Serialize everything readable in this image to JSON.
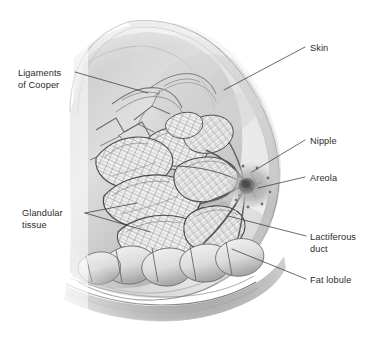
{
  "figure": {
    "name": "breast-anatomy-cross-section",
    "background_color": "#ffffff",
    "label_color": "#2b2b2b",
    "leader_color": "#3a3a3a",
    "illustration_style": "grayscale-pencil-medical-illustration"
  },
  "labels": [
    {
      "id": "ligaments-of-cooper",
      "lines": [
        "Ligaments",
        "of Cooper"
      ],
      "line1": "Ligaments",
      "line2": "of Cooper",
      "text_x": 18,
      "text_y": 76,
      "anchor": "start",
      "leader": "M 75 72 L 148 93"
    },
    {
      "id": "skin",
      "lines": [
        "Skin"
      ],
      "line1": "Skin",
      "text_x": 310,
      "text_y": 51,
      "anchor": "start",
      "leader": "M 305 47 L 224 90"
    },
    {
      "id": "nipple",
      "lines": [
        "Nipple"
      ],
      "line1": "Nipple",
      "text_x": 310,
      "text_y": 144,
      "anchor": "start",
      "leader": "M 305 140 L 252 172"
    },
    {
      "id": "areola",
      "lines": [
        "Areola"
      ],
      "line1": "Areola",
      "text_x": 310,
      "text_y": 181,
      "anchor": "start",
      "leader": "M 305 177 L 258 188"
    },
    {
      "id": "glandular-tissue",
      "lines": [
        "Glandular",
        "tissue"
      ],
      "line1": "Glandular",
      "line2": "tissue",
      "text_x": 22,
      "text_y": 216,
      "anchor": "start",
      "leader": "M 85 213 L 137 203",
      "leader2": "M 85 213 L 150 232"
    },
    {
      "id": "lactiferous-duct",
      "lines": [
        "Lactiferous",
        "duct"
      ],
      "line1": "Lactiferous",
      "line2": "duct",
      "text_x": 310,
      "text_y": 240,
      "anchor": "start",
      "leader": "M 306 236 L 228 216"
    },
    {
      "id": "fat-lobule",
      "lines": [
        "Fat lobule"
      ],
      "line1": "Fat lobule",
      "text_x": 310,
      "text_y": 283,
      "anchor": "start",
      "leader": "M 306 279 L 232 249"
    }
  ],
  "anatomy_parts": [
    "skin",
    "nipple",
    "areola",
    "lactiferous-duct",
    "glandular-lobule",
    "fat-lobule",
    "cooper-ligament",
    "chest-wall"
  ]
}
